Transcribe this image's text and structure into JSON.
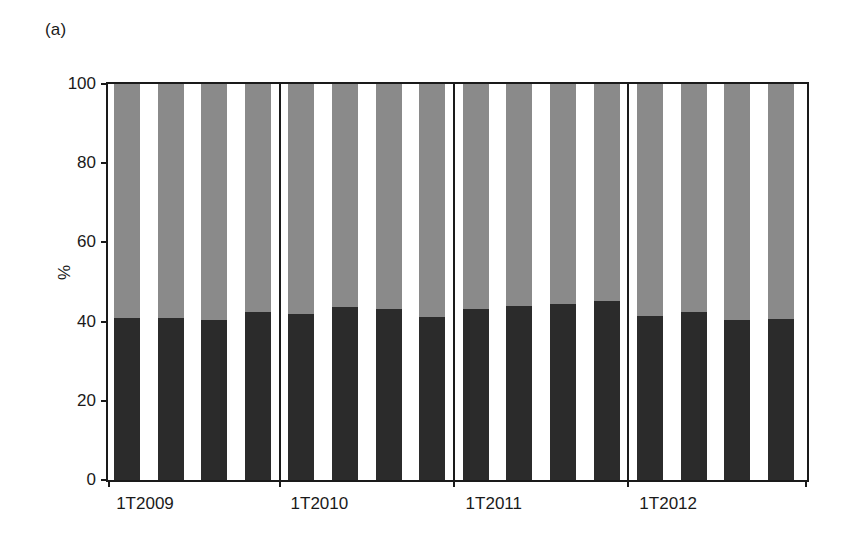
{
  "figure": {
    "panel_label": "(a)"
  },
  "chart_data": {
    "type": "bar",
    "title": "",
    "subtitle": "",
    "xlabel": "",
    "ylabel": "%",
    "ylim": [
      0,
      100
    ],
    "yticks": [
      0,
      20,
      40,
      60,
      80,
      100
    ],
    "ytick_labels": [
      "0",
      "20",
      "40",
      "60",
      "80",
      "100"
    ],
    "grid": false,
    "legend": "none",
    "stacked": true,
    "stacked_total": 100,
    "bar_count": 16,
    "categories": [
      "1T2009",
      "2T2009",
      "3T2009",
      "4T2009",
      "1T2010",
      "2T2010",
      "3T2010",
      "4T2010",
      "1T2011",
      "2T2011",
      "3T2011",
      "4T2011",
      "1T2012",
      "2T2012",
      "3T2012",
      "4T2012"
    ],
    "xtick_labels": [
      "1T2009",
      "1T2010",
      "1T2011",
      "1T2012"
    ],
    "xtick_label_indices": [
      0,
      4,
      8,
      12
    ],
    "group_separators_after": [
      4,
      8,
      12
    ],
    "series": [
      {
        "name": "lower-segment",
        "color": "#2b2b2b",
        "values": [
          41.0,
          41.0,
          40.3,
          42.5,
          42.0,
          43.8,
          43.2,
          41.2,
          43.2,
          44.0,
          44.5,
          45.2,
          41.3,
          42.4,
          40.5,
          40.6
        ]
      },
      {
        "name": "upper-segment",
        "color": "#8a8a8a",
        "values": [
          59.0,
          59.0,
          59.7,
          57.5,
          58.0,
          56.2,
          56.8,
          58.8,
          56.8,
          56.0,
          55.5,
          54.8,
          58.7,
          57.6,
          59.5,
          59.4
        ]
      }
    ]
  },
  "colors": {
    "lower_segment": "#2b2b2b",
    "upper_segment": "#8a8a8a",
    "axis": "#1a1a1a",
    "background": "#ffffff"
  }
}
